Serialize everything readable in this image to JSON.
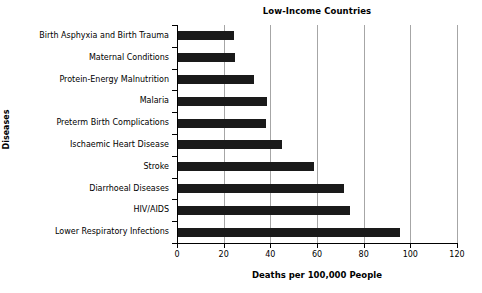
{
  "chart_data": {
    "type": "bar",
    "orientation": "horizontal",
    "title": "Low-Income Countries",
    "xlabel": "Deaths per 100,000 People",
    "ylabel": "Diseases",
    "xlim": [
      0,
      120
    ],
    "xticks": [
      0,
      20,
      40,
      60,
      80,
      100,
      120
    ],
    "xtick_labels": [
      "0",
      "20",
      "40",
      "60",
      "80",
      "100",
      "120"
    ],
    "grid": "vertical",
    "legend": "none",
    "bar_color": "#1a1a1a",
    "categories": [
      "Birth Asphyxia and Birth Trauma",
      "Maternal Conditions",
      "Protein-Energy Malnutrition",
      "Malaria",
      "Preterm Birth Complications",
      "Ischaemic Heart Disease",
      "Stroke",
      "Diarrhoeal Diseases",
      "HIV/AIDS",
      "Lower Respiratory Infections"
    ],
    "values": [
      24.5,
      25,
      33,
      38.5,
      38,
      45,
      58.5,
      71.5,
      74,
      95.5
    ]
  }
}
